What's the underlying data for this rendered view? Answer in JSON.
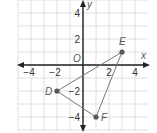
{
  "chart_data": {
    "type": "scatter",
    "title": "",
    "xlabel": "x",
    "ylabel": "y",
    "origin_label": "O",
    "xlim": [
      -5,
      5
    ],
    "ylim": [
      -5,
      5
    ],
    "grid": true,
    "x_ticks": [
      -4,
      -2,
      2,
      4
    ],
    "y_ticks": [
      4,
      2,
      -2,
      -4
    ],
    "x_tick_labels": [
      "−4",
      "−2",
      "2",
      "4"
    ],
    "y_tick_labels": [
      "4",
      "2",
      "−2",
      "−4"
    ],
    "points": [
      {
        "name": "D",
        "x": -2,
        "y": -2
      },
      {
        "name": "E",
        "x": 3,
        "y": 1
      },
      {
        "name": "F",
        "x": 1,
        "y": -4
      }
    ],
    "polygon": [
      "D",
      "E",
      "F"
    ]
  },
  "colors": {
    "grid": "#d8d8d8",
    "axis": "#222222",
    "shape": "#777777",
    "point": "#555555"
  }
}
